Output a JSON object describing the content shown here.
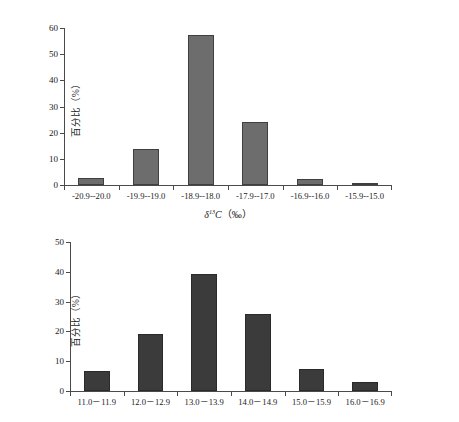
{
  "chart_data": [
    {
      "id": "top",
      "type": "bar",
      "title": "",
      "xlabel": "δ13C（‰）",
      "xlabel_parts": {
        "symbol": "δ",
        "superscript": "13",
        "element": "C",
        "unit": "（‰）"
      },
      "ylabel": "百分比（%）",
      "categories": [
        "-20.9--20.0",
        "-19.9--19.0",
        "-18.9--18.0",
        "-17.9--17.0",
        "-16.9--16.0",
        "-15.9--15.0"
      ],
      "values": [
        2.7,
        13.6,
        57.2,
        24.2,
        2.3,
        0.5
      ],
      "ylim": [
        0,
        60
      ],
      "yticks": [
        0,
        10,
        20,
        30,
        40,
        50,
        60
      ],
      "grid": false,
      "legend": "none",
      "bar_color": "#6d6d6d",
      "bar_edge_color": "#3f3f3f",
      "axis_color": "#4a4a4a"
    },
    {
      "id": "bottom",
      "type": "bar",
      "title": "",
      "xlabel": "",
      "ylabel": "百分比（%）",
      "categories": [
        "11.0－11.9",
        "12.0－12.9",
        "13.0－13.9",
        "14.0－14.9",
        "15.0－15.9",
        "16.0－16.9"
      ],
      "values": [
        6.8,
        19.0,
        39.2,
        26.0,
        7.3,
        3.0
      ],
      "ylim": [
        0,
        50
      ],
      "yticks": [
        0,
        10,
        20,
        30,
        40,
        50
      ],
      "grid": false,
      "legend": "none",
      "bar_color": "#3b3b3b",
      "bar_edge_color": "#2a2a2a",
      "axis_color": "#4a4a4a"
    }
  ]
}
